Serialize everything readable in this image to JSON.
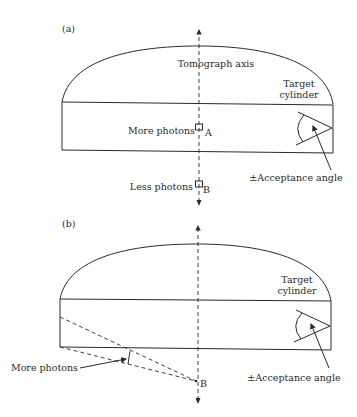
{
  "panels": [
    {
      "id": "a",
      "panel_label": "(a)",
      "axis_label": "Tomograph axis",
      "target_label_line1": "Target",
      "target_label_line2": "cylinder",
      "point_a_text": "More photons",
      "point_a_letter": "A",
      "point_b_text": "Less photons",
      "point_b_letter": "B",
      "acceptance_label": "±Acceptance angle"
    },
    {
      "id": "b",
      "panel_label": "(b)",
      "target_label_line1": "Target",
      "target_label_line2": "cylinder",
      "more_photons_label": "More photons",
      "point_b_letter": "B",
      "acceptance_label": "±Acceptance angle"
    }
  ],
  "colors": {
    "ink": "#2a2a2a",
    "background": "#ffffff"
  }
}
